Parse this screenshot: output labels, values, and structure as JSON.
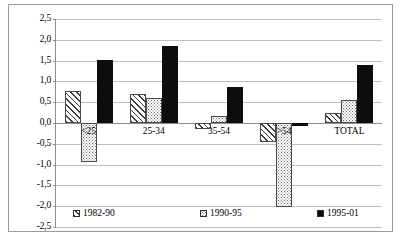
{
  "chart_data": {
    "type": "bar",
    "title": "",
    "subtitle": "",
    "xlabel": "",
    "ylabel": "",
    "categories": [
      "<25",
      "25-34",
      "35-54",
      ">54",
      "TOTAL"
    ],
    "series": [
      {
        "name": "1982-90",
        "pattern": "diagonal-hatch",
        "values": [
          0.76,
          0.7,
          -0.15,
          -0.45,
          0.25
        ]
      },
      {
        "name": "1990-95",
        "pattern": "dotted",
        "values": [
          -0.93,
          0.61,
          0.18,
          -2.03,
          0.56
        ]
      },
      {
        "name": "1995-01",
        "pattern": "solid-black",
        "values": [
          1.52,
          1.85,
          0.87,
          -0.08,
          1.39
        ]
      }
    ],
    "ylim": [
      -2.5,
      2.5
    ],
    "ytick_step": 0.5,
    "ytick_labels": [
      "2,5",
      "2,0",
      "1,5",
      "1,0",
      "0,5",
      "0,0",
      "-0,5",
      "-1,0",
      "-1,5",
      "-2,0",
      "-2,5"
    ],
    "ytick_values": [
      2.5,
      2.0,
      1.5,
      1.0,
      0.5,
      0.0,
      -0.5,
      -1.0,
      -1.5,
      -2.0,
      -2.5
    ],
    "decimal_separator": ",",
    "grid": true,
    "grid_axis": "y",
    "legend_position": "bottom",
    "colors": {
      "series_1995_01": "#0d0d0d",
      "hatch_line": "#3b3b3b",
      "dot": "#6e6e6e",
      "bar_border": "#4a4a4a",
      "gridline": "#bdbdbd",
      "axis": "#8d8d8d",
      "frame": "#9a9a9a",
      "background": "#ffffff"
    }
  },
  "legend": {
    "items": [
      {
        "label": "1982-90"
      },
      {
        "label": "1990-95"
      },
      {
        "label": "1995-01"
      }
    ]
  }
}
